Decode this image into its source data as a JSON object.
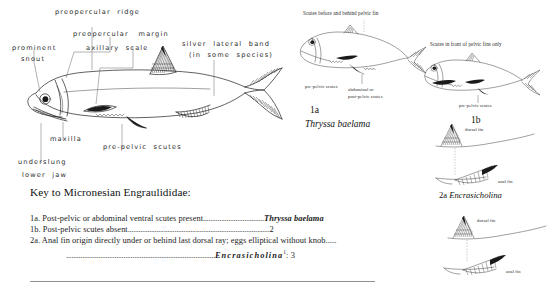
{
  "figure": {
    "main_fish": {
      "labels": [
        {
          "id": "preopercular-ridge",
          "text": "preopercular  ridge"
        },
        {
          "id": "preopercular-margin",
          "text": "preopercular   margin"
        },
        {
          "id": "prominent-snout-1",
          "text": "prominent"
        },
        {
          "id": "prominent-snout-2",
          "text": "snout"
        },
        {
          "id": "axillary-scale",
          "text": "axillary  scale"
        },
        {
          "id": "silver-lateral-band-1",
          "text": "silver  lateral  band"
        },
        {
          "id": "silver-lateral-band-2",
          "text": "(in  some  species)"
        },
        {
          "id": "maxilla",
          "text": "maxilla"
        },
        {
          "id": "pre-pelvic-scutes",
          "text": "pre-pelvic  scutes"
        },
        {
          "id": "underslung-1",
          "text": "underslung"
        },
        {
          "id": "underslung-2",
          "text": "lower  jaw"
        }
      ]
    },
    "panel_1a": {
      "caption_top": "Scutes before and behind pelvic fin",
      "label_pre_pelvic": "pre-pelvic scutes",
      "label_abdominal_1": "abdominal or",
      "label_abdominal_2": "post-pelvic scutes",
      "figure_number": "1a",
      "species": "Thryssa baelama"
    },
    "panel_1b": {
      "caption_top": "Scutes in front of pelvic fins only",
      "label_pre_pelvic": "pre-pelvic scutes",
      "figure_number": "1b"
    },
    "panel_2a": {
      "dorsal_fin_label": "dorsal fin",
      "anal_fin_label": "anal fin",
      "figure_number": "2a",
      "genus": "Encrasicholina"
    },
    "panel_2b": {
      "dorsal_fin_label": "dorsal fin",
      "anal_fin_label": "anal fin"
    }
  },
  "key": {
    "title": "Key to Micronesian Engraulididae:",
    "lines": [
      {
        "id": "key-1a",
        "lead": "1a. Post-pelvic or abdominal ventral scutes present",
        "dots": "..................................",
        "result": "Thryssa baelama",
        "result_style": "bold-italic"
      },
      {
        "id": "key-1b",
        "lead": "1b.  Post-pelvic  scutes  absent",
        "dots": "...............................................................................",
        "result": "2",
        "result_style": "plain"
      },
      {
        "id": "key-2a",
        "lead": "2a. Anal fin origin directly under or behind last dorsal ray; eggs elliptical without knob",
        "dots": "......",
        "result": "",
        "result_style": "plain"
      },
      {
        "id": "key-2a-cont",
        "lead": "",
        "dots": "...................................................................................",
        "result": "Encrasicholina",
        "result_superscript": "1",
        "result_suffix": ": 3",
        "result_style": "bold-italic"
      }
    ]
  },
  "colors": {
    "ink": "#1e1e1e",
    "paper": "#ffffff",
    "leader": "#555555",
    "rule": "#8f8f8f"
  }
}
